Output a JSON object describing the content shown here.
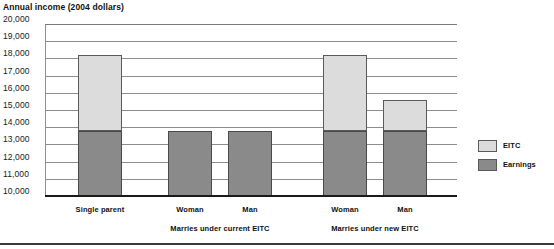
{
  "chart_data": {
    "type": "bar",
    "title": "Annual income (2004 dollars)",
    "xlabel": "",
    "ylabel": "Annual income (2004 dollars)",
    "stacked": true,
    "ylim": [
      10000,
      20000
    ],
    "ytick_step": 1000,
    "yticks": [
      "20,000",
      "19,000",
      "18,000",
      "17,000",
      "16,000",
      "15,000",
      "14,000",
      "13,000",
      "12,000",
      "11,000",
      "10,000"
    ],
    "ytick_values": [
      20000,
      19000,
      18000,
      17000,
      16000,
      15000,
      14000,
      13000,
      12000,
      11000,
      10000
    ],
    "grid": true,
    "legend_position": "right",
    "categories": [
      "Single parent",
      "Woman",
      "Man",
      "Woman",
      "Man"
    ],
    "groups": [
      {
        "label": "",
        "span": 1
      },
      {
        "label": "Marries under current EITC",
        "span": 2
      },
      {
        "label": "Marries under new EITC",
        "span": 2
      }
    ],
    "series": [
      {
        "name": "Earnings",
        "color": "#8a8a8a",
        "values": [
          13800,
          13800,
          13800,
          13800,
          13800
        ]
      },
      {
        "name": "EITC",
        "color": "#dcdcdc",
        "values": [
          4400,
          0,
          0,
          4400,
          1800
        ]
      }
    ],
    "totals": [
      18200,
      13800,
      13800,
      18200,
      15600
    ],
    "bars": [
      {
        "category": "Single parent",
        "earnings": 13800,
        "eitc": 4400,
        "total": 18200
      },
      {
        "category": "Woman",
        "earnings": 13800,
        "eitc": 0,
        "total": 13800
      },
      {
        "category": "Man",
        "earnings": 13800,
        "eitc": 0,
        "total": 13800
      },
      {
        "category": "Woman",
        "earnings": 13800,
        "eitc": 4400,
        "total": 18200
      },
      {
        "category": "Man",
        "earnings": 13800,
        "eitc": 1800,
        "total": 15600
      }
    ]
  },
  "legend": {
    "items": [
      {
        "label": "EITC",
        "color": "#dcdcdc"
      },
      {
        "label": "Earnings",
        "color": "#8a8a8a"
      }
    ]
  },
  "colors": {
    "earnings": "#8a8a8a",
    "eitc": "#dcdcdc",
    "gridline": "#8d8d8d",
    "axis": "#1a1a1a"
  }
}
